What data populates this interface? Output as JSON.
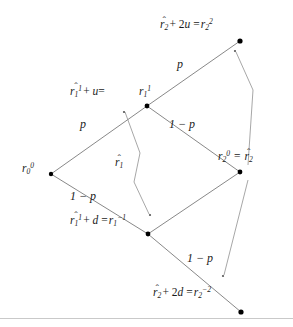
{
  "figure": {
    "caption_faint": "",
    "background_color": "#ffffff",
    "line_color": "#7a7a7a",
    "text_color": "#1a1a1a",
    "node_color": "#000000"
  },
  "nodes": [
    {
      "id": "root",
      "label_parts": {
        "base": "r",
        "sub": "0",
        "sup": "0"
      },
      "x": 51,
      "y": 174
    },
    {
      "id": "up1",
      "label_parts": {
        "base": "r",
        "sub": "1",
        "sup": "1"
      },
      "x": 147,
      "y": 106
    },
    {
      "id": "down1",
      "label_parts": {
        "base": "r",
        "sub": "1",
        "sup": "-1"
      },
      "x": 148,
      "y": 234
    },
    {
      "id": "mid2",
      "label_parts": {
        "base": "r",
        "sub": "2",
        "sup": "0"
      },
      "x": 240,
      "y": 172
    },
    {
      "id": "up2",
      "label_parts": {
        "base": "r",
        "sub": "2",
        "sup": "2"
      },
      "x": 240,
      "y": 41
    },
    {
      "id": "down2",
      "label_parts": {
        "base": "r",
        "sub": "2",
        "sup": "-2"
      },
      "x": 241,
      "y": 312
    }
  ],
  "edges": [
    {
      "from": "root",
      "to": "up1",
      "prob_label": "p"
    },
    {
      "from": "root",
      "to": "down1",
      "prob_label": "1 − p"
    },
    {
      "from": "up1",
      "to": "up2",
      "prob_label": "p"
    },
    {
      "from": "up1",
      "to": "mid2",
      "prob_label": "1 − p"
    },
    {
      "from": "down1",
      "to": "mid2",
      "prob_label": ""
    },
    {
      "from": "down1",
      "to": "down2",
      "prob_label": "1 − p"
    }
  ],
  "edge_labels": {
    "p_lower_left": "p",
    "p_upper_right": "p",
    "one_minus_p_left": "1 − p",
    "one_minus_p_middle": "1 − p",
    "one_minus_p_lower_right": "1 − p"
  },
  "annotations": {
    "top": {
      "text": "r̂₂ + 2u = r₂²",
      "hat_base": "r",
      "hat_sub": "2",
      "operator": "+ 2u =",
      "result_base": "r",
      "result_sub": "2",
      "result_sup": "2"
    },
    "upper_middle": {
      "text": "r̂₁¹ + u = r₁¹",
      "hat_base": "r",
      "hat_sub": "1",
      "hat_sup": "1",
      "operator": "+ u =",
      "result_base": "r",
      "result_sub": "1",
      "result_sup": "1"
    },
    "center": {
      "text": "r̂₁",
      "hat_base": "r",
      "hat_sub": "1"
    },
    "right": {
      "text": "r₂⁰ = r̂₂",
      "left_base": "r",
      "left_sub": "2",
      "left_sup": "0",
      "operator": "=",
      "hat_base": "r",
      "hat_sub": "2"
    },
    "lower_middle": {
      "text": "r̂₁¹ + d = r₁⁻¹",
      "hat_base": "r",
      "hat_sub": "1",
      "hat_sup": "1",
      "operator": "+ d =",
      "result_base": "r",
      "result_sub": "1",
      "result_sup": "-1"
    },
    "bottom": {
      "text": "r̂₂ + 2d = r₂⁻²",
      "hat_base": "r",
      "hat_sub": "2",
      "operator": "+ 2d =",
      "result_base": "r",
      "result_sub": "2",
      "result_sup": "-2"
    }
  }
}
